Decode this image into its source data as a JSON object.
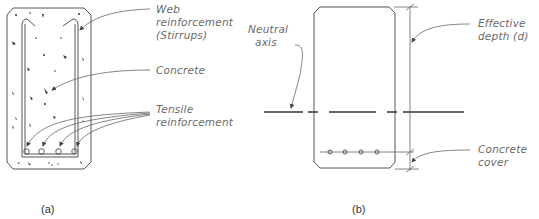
{
  "figure": {
    "panel_a": {
      "caption": "(a)",
      "labels": {
        "web_line1": "Web",
        "web_line2": "reinforcement",
        "web_line3": "(Stirrups)",
        "concrete": "Concrete",
        "tensile_line1": "Tensile",
        "tensile_line2": "reinforcement"
      },
      "rebar_count": 4
    },
    "panel_b": {
      "caption": "(b)",
      "labels": {
        "neutral_line1": "Neutral",
        "neutral_line2": "axis",
        "effective_line1": "Effective",
        "effective_line2": "depth (d)",
        "cover_line1": "Concrete",
        "cover_line2": "cover"
      },
      "rebar_count": 4
    }
  },
  "colors": {
    "line": "#555555",
    "text": "#6a6a6a",
    "background": "#ffffff"
  }
}
